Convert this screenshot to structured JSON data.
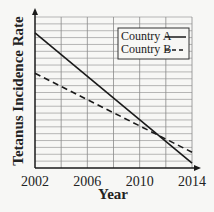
{
  "chart_data": {
    "type": "line",
    "title": "",
    "xlabel": "Year",
    "ylabel": "Tetanus Incidence Rate",
    "x_ticks": [
      "2002",
      "2006",
      "2010",
      "2014"
    ],
    "xlim": [
      2002,
      2014
    ],
    "ylim": [
      0,
      22
    ],
    "grid": true,
    "y_tick_labels": [],
    "legend_position": "upper right",
    "series": [
      {
        "name": "Country A",
        "style": "solid",
        "x": [
          2002,
          2014
        ],
        "y": [
          19.7,
          0.7
        ]
      },
      {
        "name": "Country B",
        "style": "dashed",
        "x": [
          2002,
          2014
        ],
        "y": [
          13.8,
          2.3
        ]
      }
    ]
  },
  "legend": {
    "country_a": "Country A",
    "country_b": "Country B"
  },
  "colors": {
    "line": "#1a1a1a",
    "grid": "#8a8a8a",
    "background": "#f7f7f5"
  }
}
